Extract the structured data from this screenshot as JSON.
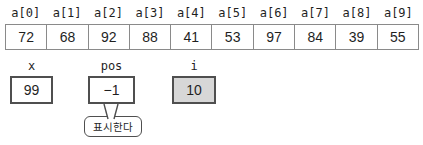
{
  "array": {
    "name": "a",
    "labels": [
      "a[0]",
      "a[1]",
      "a[2]",
      "a[3]",
      "a[4]",
      "a[5]",
      "a[6]",
      "a[7]",
      "a[8]",
      "a[9]"
    ],
    "values": [
      "72",
      "68",
      "92",
      "88",
      "41",
      "53",
      "97",
      "84",
      "39",
      "55"
    ]
  },
  "variables": [
    {
      "label": "x",
      "value": "99",
      "highlighted": false
    },
    {
      "label": "pos",
      "value": "−1",
      "highlighted": false
    },
    {
      "label": "i",
      "value": "10",
      "highlighted": true
    }
  ],
  "callout": {
    "text": "표시한다",
    "attached_to": "pos"
  },
  "colors": {
    "cell_border": "#8a8a8a",
    "box_border": "#4f4f4f",
    "highlight_fill": "#d7d7d7",
    "text": "#1f1f1f"
  }
}
